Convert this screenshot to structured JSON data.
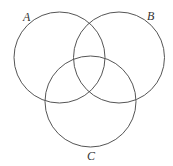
{
  "diagram": {
    "type": "venn",
    "sets": [
      {
        "label": "A",
        "cx": 59.5,
        "cy": 57.5,
        "r": 45.5,
        "label_x": 23,
        "label_y": 21
      },
      {
        "label": "B",
        "cx": 119,
        "cy": 57.5,
        "r": 45.5,
        "label_x": 147,
        "label_y": 20
      },
      {
        "label": "C",
        "cx": 90.5,
        "cy": 101.5,
        "r": 45.5,
        "label_x": 87,
        "label_y": 160
      }
    ],
    "stroke_color": "#555555"
  }
}
